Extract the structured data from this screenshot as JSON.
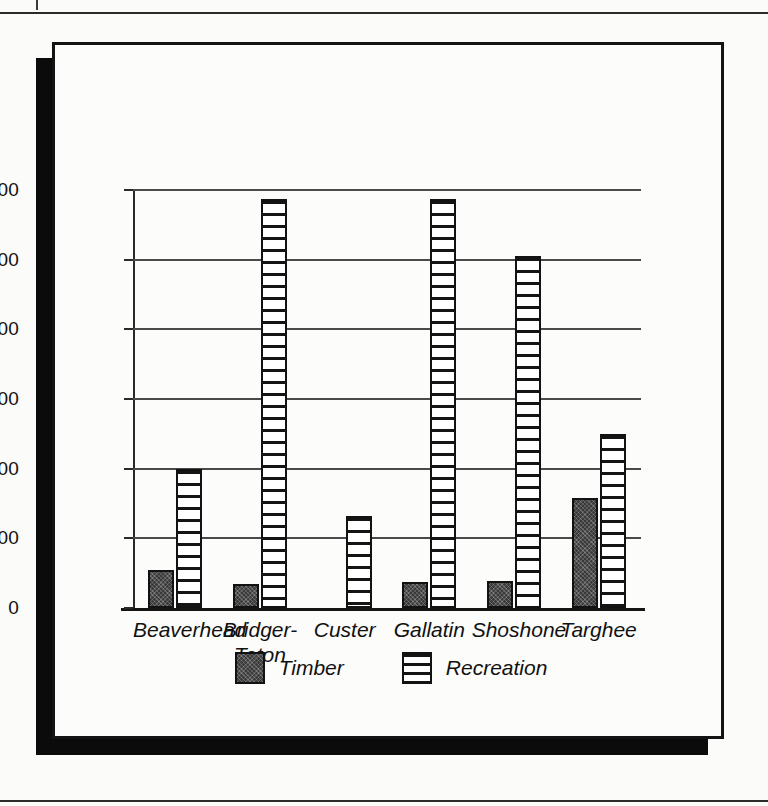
{
  "page": {
    "background_color": "#fbfbf9",
    "rule_color": "#2b2b2b"
  },
  "figure": {
    "border_color": "#141414",
    "shadow_color": "#0b0b0b",
    "panel_color": "#fcfcfa"
  },
  "legend": {
    "position": "bottom-center",
    "items": [
      {
        "label": "Timber",
        "pattern": "solid-dark-stipple",
        "color": "#3a3a3a"
      },
      {
        "label": "Recreation",
        "pattern": "horizontal-stripes",
        "color": "#141414"
      }
    ]
  },
  "chart_data": {
    "type": "bar",
    "title": "",
    "subtitle": "",
    "xlabel": "",
    "ylabel": "",
    "ylim": [
      0,
      1200
    ],
    "yticks": [
      0,
      200,
      400,
      600,
      800,
      1000,
      1200
    ],
    "ytick_labels": [
      "0",
      "200",
      "400",
      "600",
      "800",
      "1,000",
      "1,200"
    ],
    "grid": true,
    "grid_axis": "y",
    "legend_position": "bottom-center",
    "categories": [
      "Beaverhead",
      "Bridger-\nTeton",
      "Custer",
      "Gallatin",
      "Shoshone",
      "Targhee"
    ],
    "series": [
      {
        "name": "Timber",
        "values": [
          110,
          70,
          0,
          75,
          78,
          315
        ]
      },
      {
        "name": "Recreation",
        "values": [
          400,
          1175,
          265,
          1175,
          1010,
          500
        ]
      }
    ]
  }
}
